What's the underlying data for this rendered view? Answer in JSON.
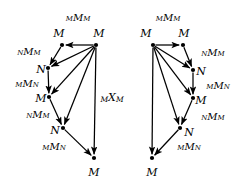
{
  "figure": {
    "type": "diagram",
    "kind": "commutative-diagram-pair",
    "background": "#ffffff",
    "stroke": "#000000",
    "width": 248,
    "height": 196,
    "center_label": {
      "name": "center-label-mxm",
      "pre": "M",
      "mid": "X",
      "post": "M",
      "x": 112,
      "y": 98
    },
    "diagrams": [
      {
        "id": "left-diagram",
        "nodes": [
          {
            "id": "L1",
            "label": "M",
            "x": 62,
            "y": 45,
            "label_x": 59,
            "label_y": 33
          },
          {
            "id": "L2",
            "label": "M",
            "x": 96,
            "y": 45,
            "label_x": 99,
            "label_y": 33
          },
          {
            "id": "L3",
            "label": "N",
            "x": 48,
            "y": 68,
            "label_x": 41,
            "label_y": 69
          },
          {
            "id": "L4",
            "label": "M",
            "x": 49,
            "y": 97,
            "label_x": 41,
            "label_y": 98
          },
          {
            "id": "L5",
            "label": "N",
            "x": 63,
            "y": 128,
            "label_x": 55,
            "label_y": 130
          },
          {
            "id": "L6",
            "label": "M",
            "x": 94,
            "y": 158,
            "label_x": 94,
            "label_y": 172
          }
        ],
        "edges": [
          {
            "from": "L2",
            "to": "L1",
            "name": "edge-l2-l1"
          },
          {
            "from": "L1",
            "to": "L3",
            "name": "edge-l1-l3"
          },
          {
            "from": "L2",
            "to": "L3",
            "name": "edge-l2-l3"
          },
          {
            "from": "L3",
            "to": "L4",
            "name": "edge-l3-l4"
          },
          {
            "from": "L2",
            "to": "L4",
            "name": "edge-l2-l4"
          },
          {
            "from": "L4",
            "to": "L5",
            "name": "edge-l4-l5"
          },
          {
            "from": "L2",
            "to": "L5",
            "name": "edge-l2-l5"
          },
          {
            "from": "L5",
            "to": "L6",
            "name": "edge-l5-l6"
          },
          {
            "from": "L2",
            "to": "L6",
            "name": "edge-l2-l6"
          }
        ],
        "edge_labels": [
          {
            "name": "label-left-top",
            "pre": "M",
            "mid": "M",
            "post": "M",
            "x": 78,
            "y": 18
          },
          {
            "name": "label-left-nmm",
            "pre": "N",
            "mid": "M",
            "post": "M",
            "x": 29,
            "y": 52
          },
          {
            "name": "label-left-mmn",
            "pre": "M",
            "mid": "M",
            "post": "N",
            "x": 27,
            "y": 84
          },
          {
            "name": "label-left-nmm-2",
            "pre": "N",
            "mid": "M",
            "post": "M",
            "x": 38,
            "y": 115
          },
          {
            "name": "label-left-mmn-2",
            "pre": "M",
            "mid": "M",
            "post": "N",
            "x": 54,
            "y": 147
          }
        ]
      },
      {
        "id": "right-diagram",
        "nodes": [
          {
            "id": "R1",
            "label": "M",
            "x": 153,
            "y": 45,
            "label_x": 146,
            "label_y": 33
          },
          {
            "id": "R2",
            "label": "M",
            "x": 183,
            "y": 45,
            "label_x": 184,
            "label_y": 33
          },
          {
            "id": "R3",
            "label": "N",
            "x": 193,
            "y": 70,
            "label_x": 201,
            "label_y": 71
          },
          {
            "id": "R4",
            "label": "M",
            "x": 193,
            "y": 98,
            "label_x": 201,
            "label_y": 100
          },
          {
            "id": "R5",
            "label": "N",
            "x": 180,
            "y": 128,
            "label_x": 189,
            "label_y": 132
          },
          {
            "id": "R6",
            "label": "M",
            "x": 152,
            "y": 158,
            "label_x": 152,
            "label_y": 172
          }
        ],
        "edges": [
          {
            "from": "R1",
            "to": "R2",
            "name": "edge-r1-r2"
          },
          {
            "from": "R2",
            "to": "R3",
            "name": "edge-r2-r3"
          },
          {
            "from": "R1",
            "to": "R3",
            "name": "edge-r1-r3"
          },
          {
            "from": "R3",
            "to": "R4",
            "name": "edge-r3-r4"
          },
          {
            "from": "R1",
            "to": "R4",
            "name": "edge-r1-r4"
          },
          {
            "from": "R4",
            "to": "R5",
            "name": "edge-r4-r5"
          },
          {
            "from": "R1",
            "to": "R5",
            "name": "edge-r1-r5"
          },
          {
            "from": "R5",
            "to": "R6",
            "name": "edge-r5-r6"
          },
          {
            "from": "R1",
            "to": "R6",
            "name": "edge-r1-r6"
          }
        ],
        "edge_labels": [
          {
            "name": "label-right-top",
            "pre": "M",
            "mid": "M",
            "post": "M",
            "x": 168,
            "y": 18
          },
          {
            "name": "label-right-nmm",
            "pre": "N",
            "mid": "M",
            "post": "M",
            "x": 213,
            "y": 53
          },
          {
            "name": "label-right-mmn",
            "pre": "M",
            "mid": "M",
            "post": "N",
            "x": 218,
            "y": 86
          },
          {
            "name": "label-right-nmm-2",
            "pre": "N",
            "mid": "M",
            "post": "M",
            "x": 213,
            "y": 117
          },
          {
            "name": "label-right-mmn-2",
            "pre": "M",
            "mid": "M",
            "post": "N",
            "x": 189,
            "y": 147
          }
        ]
      }
    ]
  }
}
